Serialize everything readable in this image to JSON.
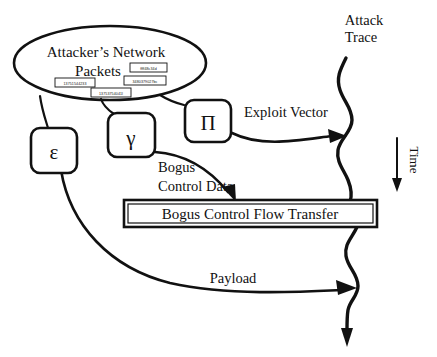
{
  "diagram": {
    "title_nodes": {
      "source_ellipse": "Attacker’s Network Packets",
      "source_ellipse_line1": "Attacker’s Network",
      "source_ellipse_line2": "Packets"
    },
    "packet_boxes": [
      {
        "name": "packet-box-1",
        "value": "ffff48c34d"
      },
      {
        "name": "packet-box-2",
        "value": "13751544233"
      },
      {
        "name": "packet-box-3",
        "value": "3480379027bc"
      },
      {
        "name": "packet-box-4",
        "value": "13753754041l"
      }
    ],
    "symbol_nodes": [
      {
        "name": "node-epsilon",
        "symbol": "ε"
      },
      {
        "name": "node-gamma",
        "symbol": "γ"
      },
      {
        "name": "node-pi",
        "symbol": "Π"
      }
    ],
    "labels": {
      "attack_trace_line1": "Attack",
      "attack_trace_line2": "Trace",
      "exploit_vector": "Exploit Vector",
      "bogus_control_data_line1": "Bogus",
      "bogus_control_data_line2": "Control Data",
      "payload": "Payload",
      "time_axis": "Time"
    },
    "bar": {
      "label": "Bogus Control Flow Transfer"
    },
    "colors": {
      "ink": "#111111",
      "paper": "#ffffff"
    }
  }
}
